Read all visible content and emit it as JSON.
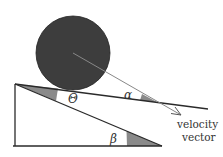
{
  "diagram": {
    "labels": {
      "theta": "Θ",
      "alpha": "α",
      "beta": "β",
      "velocity_line1": "velocity",
      "velocity_line2": "vector"
    },
    "colors": {
      "ball": "#3d3d3d",
      "line": "#2a2a2a",
      "arrow": "#888888",
      "wedge": "#8a8a8a",
      "text": "#333333"
    }
  }
}
